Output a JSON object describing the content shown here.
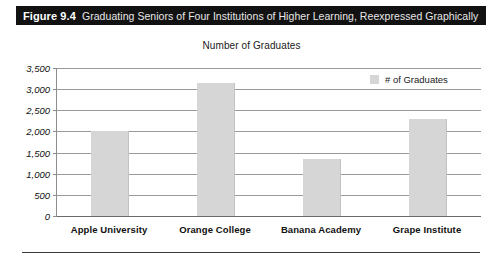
{
  "figure": {
    "number_label": "Figure 9.4",
    "caption": "Graduating Seniors of Four Institutions of Higher Learning, Reexpressed Graphically"
  },
  "legend": {
    "label": "# of Graduates",
    "swatch_color": "#d6d6d6"
  },
  "chart_data": {
    "type": "bar",
    "title": "Number of Graduates",
    "xlabel": "",
    "ylabel": "",
    "categories": [
      "Apple University",
      "Orange College",
      "Banana Academy",
      "Grape Institute"
    ],
    "series": [
      {
        "name": "# of Graduates",
        "values": [
          2000,
          3150,
          1350,
          2300
        ],
        "color": "#d6d6d6"
      }
    ],
    "ylim": [
      0,
      3500
    ],
    "ytick_values": [
      0,
      500,
      1000,
      1500,
      2000,
      2500,
      3000,
      3500
    ],
    "ytick_labels": [
      "0",
      "500",
      "1,000",
      "1,500",
      "2,000",
      "2,500",
      "3,000",
      "3,500"
    ],
    "grid": true,
    "legend_position": "top-right"
  }
}
